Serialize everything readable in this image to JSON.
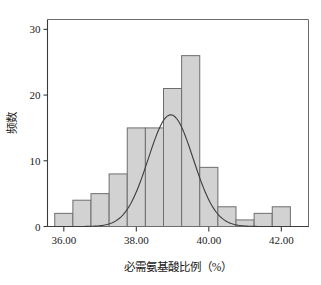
{
  "chart_data": {
    "type": "bar",
    "title": "",
    "subtitle": "",
    "xlabel": "必需氨基酸比例（%）",
    "ylabel": "频数",
    "xlim": [
      35.55,
      42.75
    ],
    "ylim": [
      0,
      31.5
    ],
    "grid": false,
    "legend": null,
    "bin_width": 0.5,
    "bin_starts": [
      35.75,
      36.25,
      36.75,
      37.25,
      37.75,
      38.25,
      38.75,
      39.25,
      39.75,
      40.25,
      40.75,
      41.25,
      41.75
    ],
    "categories": [
      "35.75-36.25",
      "36.25-36.75",
      "36.75-37.25",
      "37.25-37.75",
      "37.75-38.25",
      "38.25-38.75",
      "38.75-39.25",
      "39.25-39.75",
      "39.75-40.25",
      "40.25-40.75",
      "40.75-41.25",
      "41.25-41.75",
      "41.75-42.25"
    ],
    "values": [
      2,
      4,
      5,
      8,
      15,
      15,
      21,
      26,
      9,
      3,
      1,
      2,
      3
    ],
    "x_ticks": [
      36,
      38,
      40,
      42
    ],
    "x_tick_labels": [
      "36.00",
      "38.00",
      "40.00",
      "42.00"
    ],
    "y_ticks": [
      0,
      10,
      20,
      30
    ],
    "y_tick_labels": [
      "0",
      "10",
      "20",
      "30"
    ],
    "overlay": {
      "type": "normal_curve",
      "mean": 38.95,
      "std": 0.62,
      "peak_value": 17,
      "description": "正态分布曲线"
    },
    "colors": {
      "bar_fill": "#d2d2d2",
      "bar_stroke": "#6e6e6e",
      "curve": "#3c3c3c",
      "axis": "#3a3a3a",
      "frame": "#6b6b6b",
      "text": "#1a1a1a",
      "background": "#ffffff"
    }
  },
  "figure": {
    "x_axis_title": "必需氨基酸比例（%）",
    "y_axis_title": "频数"
  }
}
